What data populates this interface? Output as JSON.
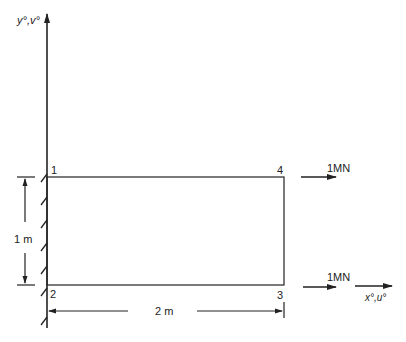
{
  "diagram": {
    "axes": {
      "y_label": "y°,v°",
      "x_label": "x°,u°"
    },
    "nodes": [
      {
        "id": "1",
        "label": "1"
      },
      {
        "id": "2",
        "label": "2"
      },
      {
        "id": "3",
        "label": "3"
      },
      {
        "id": "4",
        "label": "4"
      }
    ],
    "loads": [
      {
        "node": "4",
        "label": "1MN"
      },
      {
        "node": "3",
        "label": "1MN"
      }
    ],
    "dimensions": {
      "height": "1 m",
      "width": "2 m"
    },
    "colors": {
      "line": "#222222",
      "background": "#ffffff"
    }
  }
}
